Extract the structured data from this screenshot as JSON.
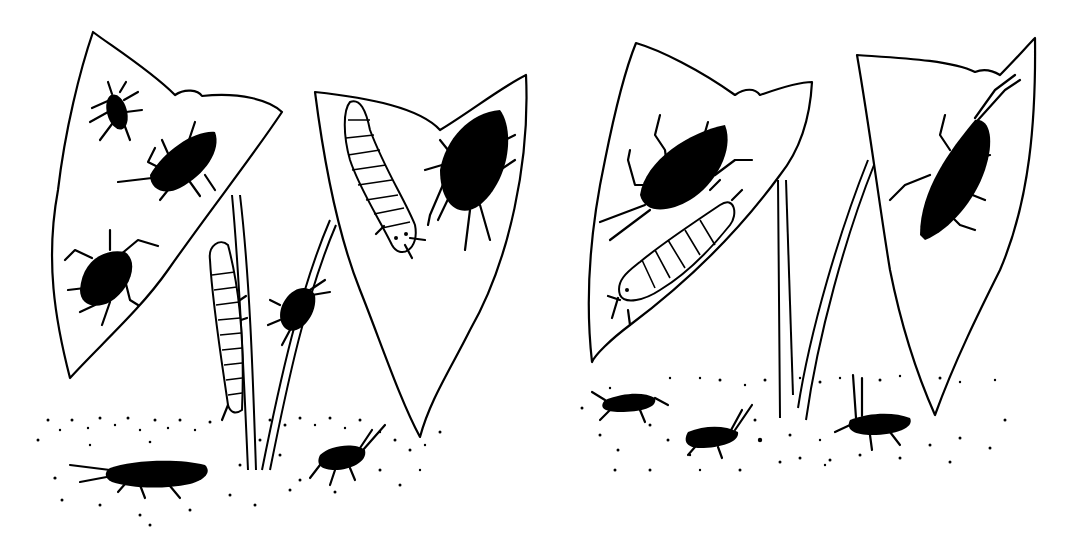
{
  "illustration": {
    "description": "Black-and-white line drawing of two plant scenes, each with two leaves on stems, insects (bugs, beetles, larvae) on leaves and on soil",
    "colors": {
      "ink": "#000000",
      "paper": "#ffffff"
    },
    "panels": [
      {
        "name": "left-panel",
        "leaves": 2,
        "insects_on_leaves": [
          "small-bug",
          "large-bug",
          "shield-bug",
          "larva-on-leaf",
          "large-beetle"
        ],
        "insects_on_stem": [
          "climbing-larva",
          "climbing-bug"
        ],
        "insects_on_ground": [
          "ground-beetle",
          "small-ground-bug"
        ]
      },
      {
        "name": "right-panel",
        "leaves": 2,
        "insects_on_leaves": [
          "large-beetle",
          "larva",
          "long-horned-bug"
        ],
        "insects_on_ground": [
          "ground-bug-1",
          "ground-bug-2",
          "ground-bug-3"
        ]
      }
    ]
  }
}
